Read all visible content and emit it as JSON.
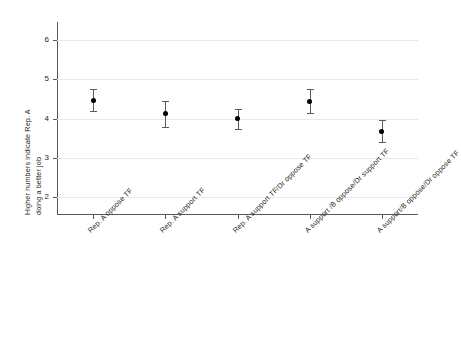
{
  "chart_data": {
    "type": "scatter",
    "title": "",
    "xlabel": "",
    "ylabel_line1": "Higher numbers indicate Rep. A",
    "ylabel_line2": "doing a better job",
    "ylim": [
      1.55,
      6.45
    ],
    "yticks": [
      2,
      3,
      4,
      5,
      6
    ],
    "ytick_labels": [
      "2",
      "3",
      "4",
      "5",
      "6"
    ],
    "grid": true,
    "legend": "none",
    "categories": [
      "Rep. A oppose TF",
      "Rep. A support TF",
      "Rep. A support TF/Dr oppose TF",
      "A support /B oppose/Dr support TF",
      "A support/B oppose/Dr oppose TF"
    ],
    "values": [
      4.47,
      4.12,
      3.99,
      4.44,
      3.68
    ],
    "error_low": [
      4.19,
      3.79,
      3.74,
      4.14,
      3.4
    ],
    "error_high": [
      4.75,
      4.45,
      4.24,
      4.74,
      3.96
    ],
    "marker": "filled-circle",
    "marker_color": "#000000",
    "errorbar_color": "#58595b",
    "gridline_color": "#e9e9ea",
    "axis_color": "#58595b"
  }
}
